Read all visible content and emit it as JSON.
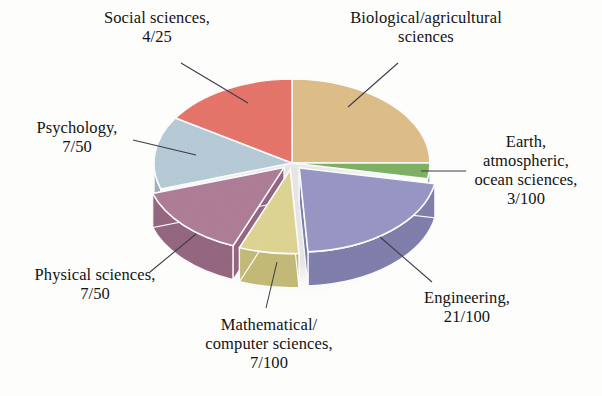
{
  "figure": {
    "background_color": "#fdfdfc",
    "cropped_title": "Science and engineering degrees"
  },
  "chart_data": {
    "type": "pie",
    "title": "",
    "xlabel": "",
    "ylabel": "",
    "legend_position": "callout-labels",
    "grid": false,
    "style": "3d-exploded-pie",
    "categories": [
      "Biological/agricultural sciences",
      "Earth, atmospheric, ocean sciences",
      "Engineering",
      "Mathematical/computer sciences",
      "Physical sciences",
      "Psychology",
      "Social sciences"
    ],
    "values": [
      0.25,
      0.03,
      0.21,
      0.07,
      0.14,
      0.14,
      0.16
    ],
    "value_labels": [
      "",
      "3/100",
      "21/100",
      "7/100",
      "7/50",
      "7/50",
      "4/25"
    ],
    "colors": [
      "#e0bf8a",
      "#7fb364",
      "#9a98c6",
      "#e0d694",
      "#b07f99",
      "#b8cdd9",
      "#e8766c"
    ],
    "slices": [
      {
        "name": "Biological/agricultural sciences",
        "label_line1": "Biological/agricultural",
        "label_line2": "sciences",
        "label_line3": "",
        "fraction_text": "",
        "value": 0.25,
        "percent": 25,
        "color": "#e0bf8a",
        "side_color": "#c9a471",
        "exploded": false
      },
      {
        "name": "Earth, atmospheric, ocean sciences",
        "label_line1": "Earth,",
        "label_line2": "atmospheric,",
        "label_line3": "ocean sciences,",
        "fraction_text": "3/100",
        "value": 0.03,
        "percent": 3,
        "color": "#7fb364",
        "side_color": "#6a9a52",
        "exploded": false
      },
      {
        "name": "Engineering",
        "label_line1": "Engineering,",
        "label_line2": "",
        "label_line3": "",
        "fraction_text": "21/100",
        "value": 0.21,
        "percent": 21,
        "color": "#9a98c6",
        "side_color": "#8280ad",
        "exploded": true
      },
      {
        "name": "Mathematical/computer sciences",
        "label_line1": "Mathematical/",
        "label_line2": "computer sciences,",
        "label_line3": "",
        "fraction_text": "7/100",
        "value": 0.07,
        "percent": 7,
        "color": "#e0d694",
        "side_color": "#c6bc79",
        "exploded": true
      },
      {
        "name": "Physical sciences",
        "label_line1": "Physical sciences,",
        "label_line2": "",
        "label_line3": "",
        "fraction_text": "7/50",
        "value": 0.14,
        "percent": 14,
        "color": "#b07f99",
        "side_color": "#966882",
        "exploded": true
      },
      {
        "name": "Psychology",
        "label_line1": "Psychology,",
        "label_line2": "",
        "label_line3": "",
        "fraction_text": "7/50",
        "value": 0.14,
        "percent": 14,
        "color": "#b8cdd9",
        "side_color": "#9eb4c1",
        "exploded": false
      },
      {
        "name": "Social sciences",
        "label_line1": "Social sciences,",
        "label_line2": "",
        "label_line3": "",
        "fraction_text": "4/25",
        "value": 0.16,
        "percent": 16,
        "color": "#e8766c",
        "side_color": "#cd5c53",
        "exploded": false
      }
    ]
  },
  "labels": {
    "social_sciences": "Social sciences,\n4/25",
    "biological": "Biological/agricultural\nsciences",
    "psychology": "Psychology,\n7/50",
    "earth": "Earth,\natmospheric,\nocean sciences,\n3/100",
    "physical": "Physical sciences,\n7/50",
    "mathematical": "Mathematical/\ncomputer sciences,\n7/100",
    "engineering": "Engineering,\n21/100"
  }
}
